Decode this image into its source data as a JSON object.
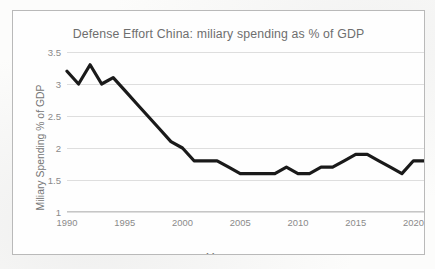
{
  "chart_data": {
    "type": "line",
    "title": "Defense Effort China: miliary spending as % of GDP",
    "xlabel": "Year",
    "ylabel": "Miliary Spending % of GDP",
    "xlim": [
      1990,
      2021
    ],
    "ylim": [
      1,
      3.5
    ],
    "grid": true,
    "legend": "none",
    "line_color": "#1a1a1a",
    "grid_color": "#dedede",
    "text_color": "#7d7d7d",
    "background_color": "#fefefe",
    "ytick_labels": [
      "1",
      "1.5",
      "2",
      "2.5",
      "3",
      "3.5"
    ],
    "ytick_values": [
      1,
      1.5,
      2,
      2.5,
      3,
      3.5
    ],
    "xtick_labels": [
      "1990",
      "1995",
      "2000",
      "2005",
      "2010",
      "2015",
      "2020"
    ],
    "xtick_values": [
      1990,
      1995,
      2000,
      2005,
      2010,
      2015,
      2020
    ],
    "series": [
      {
        "name": "Military spending % of GDP",
        "x": [
          1990,
          1991,
          1992,
          1993,
          1994,
          1995,
          1996,
          1997,
          1998,
          1999,
          2000,
          2001,
          2002,
          2003,
          2004,
          2005,
          2006,
          2007,
          2008,
          2009,
          2010,
          2011,
          2012,
          2013,
          2014,
          2015,
          2016,
          2017,
          2018,
          2019,
          2020,
          2021
        ],
        "values": [
          3.2,
          3.0,
          3.3,
          3.0,
          3.1,
          2.9,
          2.7,
          2.5,
          2.3,
          2.1,
          2.0,
          1.8,
          1.8,
          1.8,
          1.7,
          1.6,
          1.6,
          1.6,
          1.6,
          1.7,
          1.6,
          1.6,
          1.7,
          1.7,
          1.8,
          1.9,
          1.9,
          1.8,
          1.7,
          1.6,
          1.8,
          1.8
        ]
      }
    ]
  }
}
